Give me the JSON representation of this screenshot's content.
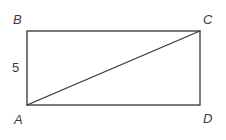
{
  "figure": {
    "background_color": "#ffffff",
    "stroke_color": "#333333",
    "label_color": "#3b3b3b",
    "canvas": {
      "width": 226,
      "height": 140
    },
    "vertices": {
      "A": {
        "label": "A",
        "x": 27,
        "y": 105
      },
      "B": {
        "label": "B",
        "x": 27,
        "y": 31
      },
      "C": {
        "label": "C",
        "x": 200,
        "y": 31
      },
      "D": {
        "label": "D",
        "x": 200,
        "y": 105
      }
    },
    "rectangle": {
      "x": 27,
      "y": 31,
      "width": 173,
      "height": 74,
      "stroke_width": 1.3
    },
    "diagonal": {
      "name": "AC",
      "x1": 27,
      "y1": 105,
      "x2": 200,
      "y2": 31,
      "stroke_width": 1.1
    },
    "measures": [
      {
        "side": "AB",
        "label": "5"
      }
    ]
  }
}
